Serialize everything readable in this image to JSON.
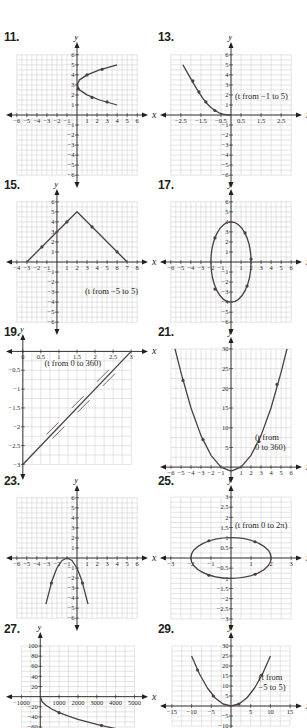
{
  "colors": {
    "grid": "#c8c8c8",
    "axis": "#231f20",
    "curve": "#4a3f45",
    "text": "#231f20",
    "background": "#ffffff"
  },
  "panels": [
    {
      "number": "11.",
      "note": ""
    },
    {
      "number": "13.",
      "note": "(t from −1 to 5)"
    },
    {
      "number": "15.",
      "note": "(t from −5 to 5)"
    },
    {
      "number": "17.",
      "note": ""
    },
    {
      "number": "19.",
      "note": "(t from 0 to 360)"
    },
    {
      "number": "21.",
      "note": "(t from 0 to 360)"
    },
    {
      "number": "23.",
      "note": ""
    },
    {
      "number": "25.",
      "note": "(t from 0 to 2π)"
    },
    {
      "number": "27.",
      "note": ""
    },
    {
      "number": "29.",
      "note": "(t from −5 to 5)"
    }
  ],
  "chart_data": [
    {
      "id": "11",
      "type": "line",
      "title": "11.",
      "xlabel": "x",
      "ylabel": "y",
      "xlim": [
        -6,
        6
      ],
      "ylim": [
        -6,
        6
      ],
      "grid": true,
      "xticks": [
        -6,
        -5,
        -4,
        -3,
        -2,
        -1,
        1,
        2,
        3,
        4,
        5,
        6
      ],
      "yticks": [
        -6,
        -5,
        -4,
        -3,
        -2,
        -1,
        1,
        2,
        3,
        4,
        5,
        6
      ],
      "description": "Sideways parabola opening right, vertex (0,3), upper branch to (4,5), lower branch to (4,1)",
      "points": [
        [
          4,
          5
        ],
        [
          2.25,
          4.5
        ],
        [
          1,
          4
        ],
        [
          0.25,
          3.5
        ],
        [
          0,
          3
        ],
        [
          0.25,
          2.5
        ],
        [
          1,
          2
        ],
        [
          2.25,
          1.5
        ],
        [
          4,
          1
        ]
      ],
      "arrows": [
        [
          1,
          4
        ],
        [
          2.5,
          4.55
        ],
        [
          0.1,
          2.6
        ],
        [
          1.5,
          1.75
        ],
        [
          3,
          1.3
        ]
      ]
    },
    {
      "id": "13",
      "type": "line",
      "title": "13.",
      "xlabel": "x",
      "ylabel": "y",
      "xlim": [
        -3,
        3
      ],
      "ylim": [
        -6,
        6
      ],
      "grid": true,
      "xticks": [
        -2.5,
        -1.5,
        -0.5,
        0.5,
        1.5,
        2.5
      ],
      "yticks": [
        -6,
        -5,
        -4,
        -3,
        -2,
        -1,
        1,
        2,
        3,
        4,
        5,
        6
      ],
      "annotation": "(t from −1 to 5)",
      "description": "Decreasing curve from (-2.4,5) to (0,0)",
      "points": [
        [
          -2.4,
          5
        ],
        [
          -2.2,
          4.3
        ],
        [
          -2,
          3.6
        ],
        [
          -1.8,
          2.9
        ],
        [
          -1.6,
          2.25
        ],
        [
          -1.4,
          1.65
        ],
        [
          -1.2,
          1.15
        ],
        [
          -1,
          0.75
        ],
        [
          -0.8,
          0.45
        ],
        [
          -0.6,
          0.22
        ],
        [
          -0.4,
          0.08
        ],
        [
          -0.2,
          0.01
        ],
        [
          0,
          0
        ]
      ],
      "arrows": [
        [
          -1.9,
          3.4
        ],
        [
          -1.6,
          2.3
        ],
        [
          -1.25,
          1.3
        ],
        [
          -0.8,
          0.45
        ]
      ]
    },
    {
      "id": "15",
      "type": "line",
      "title": "15.",
      "xlabel": "x",
      "ylabel": "y",
      "xlim": [
        -4,
        8
      ],
      "ylim": [
        -6,
        6
      ],
      "grid": true,
      "xticks": [
        -4,
        -3,
        -2,
        -1,
        1,
        2,
        3,
        4,
        5,
        6,
        7,
        8
      ],
      "yticks": [
        -6,
        -5,
        -4,
        -3,
        -2,
        -1,
        1,
        2,
        3,
        4,
        5,
        6
      ],
      "annotation": "(t from −5 to 5)",
      "description": "Inverted V from (-3,0) up to peak (2,5) down to (7,0)",
      "points": [
        [
          -3,
          0
        ],
        [
          2,
          5
        ],
        [
          7,
          0
        ]
      ],
      "arrows": [
        [
          -1.5,
          1.5
        ],
        [
          1,
          4
        ],
        [
          3.5,
          3.5
        ],
        [
          6,
          1
        ]
      ]
    },
    {
      "id": "17",
      "type": "line",
      "title": "17.",
      "xlabel": "x",
      "ylabel": "y",
      "xlim": [
        -6,
        6
      ],
      "ylim": [
        -6,
        6
      ],
      "grid": true,
      "xticks": [
        -6,
        -5,
        -4,
        -3,
        -2,
        -1,
        1,
        2,
        3,
        4,
        5,
        6
      ],
      "yticks": [
        -6,
        -5,
        -4,
        -3,
        -2,
        -1,
        1,
        2,
        3,
        4,
        5,
        6
      ],
      "description": "Vertical ellipse centered at origin, semi-axes 2 (x) and 4 (y)",
      "ellipse": {
        "cx": 0,
        "cy": 0,
        "rx": 2,
        "ry": 4
      },
      "arrows": [
        [
          -1.6,
          2.4
        ],
        [
          1.4,
          2.9
        ],
        [
          2,
          0.3
        ],
        [
          1.6,
          -2.4
        ],
        [
          -1.6,
          -2.7
        ]
      ]
    },
    {
      "id": "19",
      "type": "line",
      "title": "19.",
      "xlabel": "x",
      "ylabel": "y",
      "xlim": [
        0,
        3
      ],
      "ylim": [
        -3,
        0
      ],
      "grid": true,
      "xticks": [
        0,
        0.5,
        1.0,
        1.5,
        2.0,
        2.5,
        3.0
      ],
      "yticks": [
        -0.5,
        -1.0,
        -1.5,
        -2.0,
        -2.5,
        -3.0
      ],
      "annotation": "(t from 0 to 360)",
      "description": "Straight line segment from (0,-3) to (3,0) traced back and forth",
      "points": [
        [
          0,
          -3
        ],
        [
          3,
          0
        ]
      ],
      "double_arrows": [
        [
          0.9,
          -2.1
        ],
        [
          1.6,
          -1.4
        ],
        [
          2.3,
          -0.7
        ]
      ]
    },
    {
      "id": "21",
      "type": "line",
      "title": "21.",
      "xlabel": "x",
      "ylabel": "y",
      "xlim": [
        -6,
        6
      ],
      "ylim": [
        0,
        30
      ],
      "grid": true,
      "xticks": [
        -6,
        -5,
        -4,
        -3,
        -2,
        -1,
        1,
        2,
        3,
        4,
        5,
        6
      ],
      "yticks": [
        5,
        10,
        15,
        20,
        25,
        30
      ],
      "annotation": "(t from 0 to 360)",
      "description": "Upward parabola y = x^2 - 1 style, vertex near (0,-1), reaching y=30 at x about ±5.6",
      "points": [
        [
          -5.6,
          30
        ],
        [
          -5,
          24
        ],
        [
          -4,
          15
        ],
        [
          -3,
          8
        ],
        [
          -2,
          3
        ],
        [
          -1,
          0
        ],
        [
          0,
          -1
        ],
        [
          1,
          0
        ],
        [
          2,
          3
        ],
        [
          3,
          8
        ],
        [
          4,
          15
        ],
        [
          5,
          24
        ],
        [
          5.6,
          30
        ]
      ],
      "arrows": [
        [
          -4.8,
          22
        ],
        [
          -2.8,
          7
        ],
        [
          2.8,
          6.5
        ],
        [
          4.6,
          21
        ]
      ]
    },
    {
      "id": "23",
      "type": "line",
      "title": "23.",
      "xlabel": "x",
      "ylabel": "y",
      "xlim": [
        -6,
        6
      ],
      "ylim": [
        -6,
        6
      ],
      "grid": true,
      "xticks": [
        -6,
        -5,
        -4,
        -3,
        -2,
        -1,
        1,
        2,
        3,
        4,
        5,
        6
      ],
      "yticks": [
        -6,
        -5,
        -4,
        -3,
        -2,
        -1,
        1,
        2,
        3,
        4,
        5,
        6
      ],
      "description": "Downward parabola with vertex (-1,0), arms to (-3,-4.5) and (1,-4.5)",
      "points": [
        [
          -3.1,
          -4.6
        ],
        [
          -2.5,
          -2.3
        ],
        [
          -2,
          -1
        ],
        [
          -1.5,
          -0.25
        ],
        [
          -1,
          0
        ],
        [
          -0.5,
          -0.25
        ],
        [
          0,
          -1
        ],
        [
          0.5,
          -2.3
        ],
        [
          1.1,
          -4.6
        ]
      ],
      "arrows": [
        [
          -2.55,
          -2.5
        ],
        [
          0.55,
          -2.5
        ]
      ]
    },
    {
      "id": "25",
      "type": "line",
      "title": "25.",
      "xlabel": "x",
      "ylabel": "y",
      "xlim": [
        -3,
        3
      ],
      "ylim": [
        -3,
        3
      ],
      "grid": true,
      "xticks": [
        -3,
        -2,
        -1,
        1,
        2,
        3
      ],
      "yticks": [
        -3.0,
        -2.5,
        -2.0,
        -1.5,
        -1.0,
        -0.5,
        0.5,
        1.0,
        1.5,
        2.0,
        2.5,
        3.0
      ],
      "annotation": "(t from 0 to 2π)",
      "description": "Horizontal ellipse centered at origin, semi-axes 2 (x) and 1 (y)",
      "ellipse": {
        "cx": 0,
        "cy": 0,
        "rx": 2,
        "ry": 1
      },
      "arrows": [
        [
          -1.1,
          0.85
        ],
        [
          1.2,
          0.8
        ],
        [
          -1.1,
          -0.85
        ],
        [
          1.2,
          -0.8
        ]
      ]
    },
    {
      "id": "27",
      "type": "line",
      "title": "27.",
      "xlabel": "x",
      "ylabel": "y",
      "xlim": [
        -1000,
        5000
      ],
      "ylim": [
        -60,
        100
      ],
      "grid": true,
      "xticks": [
        -1000,
        1000,
        2000,
        3000,
        4000,
        5000
      ],
      "yticks": [
        -60,
        -40,
        -20,
        20,
        40,
        60,
        80,
        100
      ],
      "description": "Decreasing concave-up curve starting at origin, y = -sqrt(x) style, through (1000,-32) and (3250,-57)",
      "points": [
        [
          0,
          0
        ],
        [
          100,
          -10
        ],
        [
          300,
          -17
        ],
        [
          600,
          -24.5
        ],
        [
          1000,
          -31.6
        ],
        [
          1500,
          -38.7
        ],
        [
          2000,
          -44.7
        ],
        [
          2500,
          -50
        ],
        [
          3000,
          -54.8
        ],
        [
          3500,
          -59.2
        ],
        [
          4500,
          -67
        ]
      ],
      "arrows": [
        [
          1000,
          -31.6
        ],
        [
          3250,
          -57
        ]
      ]
    },
    {
      "id": "29",
      "type": "line",
      "title": "29.",
      "xlabel": "x",
      "ylabel": "y",
      "xlim": [
        -15,
        15
      ],
      "ylim": [
        -10,
        30
      ],
      "grid": true,
      "xticks": [
        -15,
        -10,
        -5,
        5,
        10,
        15
      ],
      "yticks": [
        -10,
        -5,
        5,
        10,
        15,
        20,
        25,
        30
      ],
      "annotation": "(t from −5 to 5)",
      "description": "Upward parabola y = x^2/4, vertex (0,0), through (-10,25) and (10,25)",
      "points": [
        [
          -10,
          25
        ],
        [
          -8,
          16
        ],
        [
          -6,
          9
        ],
        [
          -4,
          4
        ],
        [
          -2,
          1
        ],
        [
          0,
          0
        ],
        [
          2,
          1
        ],
        [
          4,
          4
        ],
        [
          6,
          9
        ],
        [
          8,
          16
        ],
        [
          10,
          25
        ]
      ],
      "arrows": [
        [
          -8.5,
          18
        ],
        [
          -4.5,
          5
        ],
        [
          2,
          1
        ],
        [
          7.8,
          15.5
        ]
      ]
    }
  ]
}
